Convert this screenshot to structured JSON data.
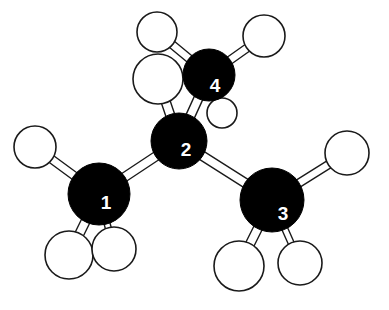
{
  "figure": {
    "background_color": "#ffffff",
    "width": 389,
    "height": 310
  },
  "style": {
    "carbon_color": "#000000",
    "hydrogen_fill": "#ffffff",
    "outline_color": "#1a1a1a",
    "label_color": "#ffffff",
    "bond_fill": "#ffffff"
  },
  "chart_data": {
    "type": "diagram",
    "carbons": [
      {
        "label": "1",
        "cx": 99,
        "cy": 194,
        "r": 31,
        "label_x": 106,
        "label_y": 202,
        "font_size": 19
      },
      {
        "label": "2",
        "cx": 179,
        "cy": 141,
        "r": 28,
        "label_x": 186,
        "label_y": 149,
        "font_size": 19
      },
      {
        "label": "3",
        "cx": 272,
        "cy": 200,
        "r": 32,
        "label_x": 283,
        "label_y": 213,
        "font_size": 19
      },
      {
        "label": "4",
        "cx": 209,
        "cy": 75,
        "r": 26,
        "label_x": 215,
        "label_y": 85,
        "font_size": 19
      }
    ],
    "hydrogens": [
      {
        "name": "h-c1-upper-left",
        "cx": 35,
        "cy": 147,
        "r": 21
      },
      {
        "name": "h-c1-lower-left",
        "cx": 69,
        "cy": 255,
        "r": 24
      },
      {
        "name": "h-c1-lower-right",
        "cx": 114,
        "cy": 249,
        "r": 22
      },
      {
        "name": "h-c2-upper",
        "cx": 158,
        "cy": 79,
        "r": 25
      },
      {
        "name": "h-c3-upper-right",
        "cx": 347,
        "cy": 153,
        "r": 22
      },
      {
        "name": "h-c3-lower-left",
        "cx": 239,
        "cy": 266,
        "r": 25
      },
      {
        "name": "h-c3-lower-right",
        "cx": 300,
        "cy": 263,
        "r": 22
      },
      {
        "name": "h-c4-top-left",
        "cx": 157,
        "cy": 32,
        "r": 20
      },
      {
        "name": "h-c4-top-right",
        "cx": 264,
        "cy": 36,
        "r": 21
      },
      {
        "name": "h-c4-front",
        "cx": 222,
        "cy": 113,
        "r": 15
      }
    ],
    "bonds": [
      {
        "name": "bond-c1-c2",
        "from": "c1",
        "to": "c2",
        "x1": 99,
        "y1": 194,
        "x2": 179,
        "y2": 141,
        "width": 9
      },
      {
        "name": "bond-c2-c3",
        "from": "c2",
        "to": "c3",
        "x1": 179,
        "y1": 141,
        "x2": 272,
        "y2": 200,
        "width": 9
      },
      {
        "name": "bond-c2-c4",
        "from": "c2",
        "to": "c4",
        "x1": 179,
        "y1": 141,
        "x2": 209,
        "y2": 75,
        "width": 9
      },
      {
        "name": "bond-c1-h-upper-left",
        "from": "c1",
        "to": "h-c1-upper-left",
        "x1": 99,
        "y1": 194,
        "x2": 35,
        "y2": 147,
        "width": 8
      },
      {
        "name": "bond-c1-h-lower-left",
        "from": "c1",
        "to": "h-c1-lower-left",
        "x1": 99,
        "y1": 194,
        "x2": 69,
        "y2": 255,
        "width": 9
      },
      {
        "name": "bond-c1-h-lower-right",
        "from": "c1",
        "to": "h-c1-lower-right",
        "x1": 99,
        "y1": 194,
        "x2": 114,
        "y2": 249,
        "width": 6
      },
      {
        "name": "bond-c2-h-upper",
        "from": "c2",
        "to": "h-c2-upper",
        "x1": 179,
        "y1": 141,
        "x2": 158,
        "y2": 79,
        "width": 9
      },
      {
        "name": "bond-c3-h-upper-right",
        "from": "c3",
        "to": "h-c3-upper-right",
        "x1": 272,
        "y1": 200,
        "x2": 347,
        "y2": 153,
        "width": 8
      },
      {
        "name": "bond-c3-h-lower-left",
        "from": "c3",
        "to": "h-c3-lower-left",
        "x1": 272,
        "y1": 200,
        "x2": 239,
        "y2": 266,
        "width": 9
      },
      {
        "name": "bond-c3-h-lower-right",
        "from": "c3",
        "to": "h-c3-lower-right",
        "x1": 272,
        "y1": 200,
        "x2": 300,
        "y2": 263,
        "width": 6
      },
      {
        "name": "bond-c4-h-top-left",
        "from": "c4",
        "to": "h-c4-top-left",
        "x1": 209,
        "y1": 75,
        "x2": 157,
        "y2": 32,
        "width": 8
      },
      {
        "name": "bond-c4-h-top-right",
        "from": "c4",
        "to": "h-c4-top-right",
        "x1": 209,
        "y1": 75,
        "x2": 264,
        "y2": 36,
        "width": 8
      },
      {
        "name": "bond-c4-h-front",
        "from": "c4",
        "to": "h-c4-front",
        "x1": 209,
        "y1": 75,
        "x2": 222,
        "y2": 113,
        "width": 6
      }
    ]
  }
}
